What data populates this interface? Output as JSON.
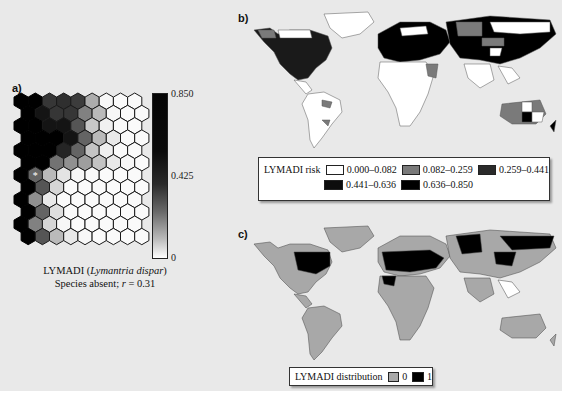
{
  "panel_a": {
    "label": "a)",
    "caption_line1_prefix": "LYMADI (",
    "caption_species": "Lymantria dispar",
    "caption_line1_suffix": ")",
    "caption_line2_prefix": "Species absent; ",
    "caption_r_symbol": "r",
    "caption_line2_suffix": " = 0.31",
    "colorbar": {
      "max": "0.850",
      "mid": "0.425",
      "min": "0"
    },
    "marker": "*",
    "grid_cols": 9,
    "grid_rows": 12,
    "grid_values": [
      [
        0.85,
        0.85,
        0.7,
        0.72,
        0.68,
        0.3,
        0.03,
        0.02,
        0.02
      ],
      [
        0.85,
        0.8,
        0.7,
        0.7,
        0.45,
        0.25,
        0.03,
        0.02,
        0.02
      ],
      [
        0.85,
        0.85,
        0.8,
        0.8,
        0.6,
        0.2,
        0.05,
        0.02,
        0.02
      ],
      [
        0.85,
        0.85,
        0.85,
        0.8,
        0.55,
        0.25,
        0.08,
        0.02,
        0.02
      ],
      [
        0.85,
        0.85,
        0.85,
        0.75,
        0.55,
        0.22,
        0.06,
        0.02,
        0.02
      ],
      [
        0.85,
        0.85,
        0.5,
        0.4,
        0.35,
        0.22,
        0.08,
        0.03,
        0.02
      ],
      [
        0.85,
        0.55,
        0.25,
        0.1,
        0.03,
        0.02,
        0.02,
        0.02,
        0.02
      ],
      [
        0.85,
        0.6,
        0.15,
        0.02,
        0.02,
        0.02,
        0.02,
        0.02,
        0.02
      ],
      [
        0.85,
        0.4,
        0.08,
        0.02,
        0.02,
        0.02,
        0.02,
        0.02,
        0.02
      ],
      [
        0.85,
        0.55,
        0.12,
        0.02,
        0.02,
        0.02,
        0.02,
        0.02,
        0.02
      ],
      [
        0.85,
        0.45,
        0.15,
        0.03,
        0.02,
        0.02,
        0.02,
        0.02,
        0.02
      ],
      [
        0.85,
        0.6,
        0.25,
        0.08,
        0.03,
        0.02,
        0.02,
        0.02,
        0.02
      ]
    ],
    "marker_cell": [
      6,
      1
    ]
  },
  "panel_b": {
    "label": "b)",
    "legend_title": "LYMADI risk",
    "legend_items": [
      {
        "range": "0.000–0.082",
        "color": "#ffffff"
      },
      {
        "range": "0.082–0.259",
        "color": "#7a7a7a"
      },
      {
        "range": "0.259–0.441",
        "color": "#2a2a2a"
      },
      {
        "range": "0.441–0.636",
        "color": "#0d0d0d"
      },
      {
        "range": "0.636–0.850",
        "color": "#000000"
      }
    ]
  },
  "panel_c": {
    "label": "c)",
    "legend_title": "LYMADI distribution",
    "legend_items": [
      {
        "value": "0",
        "color": "#a8a8a8"
      },
      {
        "value": "1",
        "color": "#000000"
      }
    ]
  },
  "colors": {
    "panel_bg": "#e9e9e9",
    "land_absent_c": "#a8a8a8",
    "presence": "#000000"
  }
}
